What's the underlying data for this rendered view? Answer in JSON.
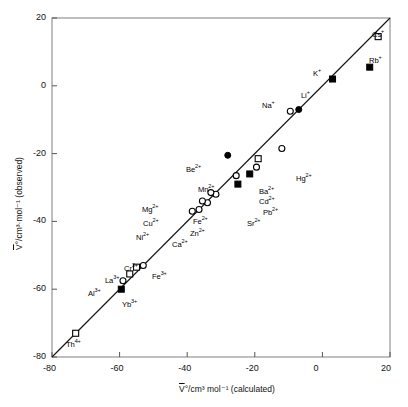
{
  "chart_data": {
    "type": "scatter",
    "title": "",
    "xlabel": "V̄°/cm³ mol⁻¹ (calculated)",
    "ylabel": "V̄°/cm³·mol⁻¹ (observed)",
    "xlim": [
      -80,
      20
    ],
    "ylim": [
      -80,
      20
    ],
    "xticks": [
      -80,
      -60,
      -40,
      -20,
      0,
      20
    ],
    "xticklabels": [
      "-80",
      "-60",
      "-40",
      "-20",
      "0",
      "20"
    ],
    "yticks": [
      -80,
      -60,
      -40,
      -20,
      0,
      20
    ],
    "yticklabels": [
      "-80",
      "-60",
      "-40",
      "-20",
      "0",
      "20"
    ],
    "grid": false,
    "legend": "none",
    "reference_line": {
      "name": "one-to-one-line",
      "description": "y = x diagonal",
      "slope": 1,
      "intercept": 0,
      "from": [
        -80,
        -80
      ],
      "to": [
        20,
        20
      ]
    },
    "marker_styles": {
      "open-circle": "open circle",
      "filled-circle": "filled circle",
      "open-square": "open square",
      "filled-square": "filled square"
    },
    "points": [
      {
        "label": "Cs⁺",
        "html": "Cs<sup>+</sup>",
        "x": 16.5,
        "y": 14.5,
        "marker": "open-square",
        "lx": 372,
        "ly": 30
      },
      {
        "label": "Rb⁺",
        "html": "Rb<sup>+</sup>",
        "x": 14.0,
        "y": 5.5,
        "marker": "filled-square",
        "lx": 369,
        "ly": 56
      },
      {
        "label": "K⁺",
        "html": "K<sup>+</sup>",
        "x": 3.0,
        "y": 2.0,
        "marker": "filled-square",
        "lx": 313,
        "ly": 69
      },
      {
        "label": "Li⁺",
        "html": "Li<sup>+</sup>",
        "x": -7.0,
        "y": -7.0,
        "marker": "filled-circle",
        "lx": 301,
        "ly": 91
      },
      {
        "label": "Na⁺",
        "html": "Na<sup>+</sup>",
        "x": -9.5,
        "y": -7.5,
        "marker": "open-circle",
        "lx": 262,
        "ly": 101
      },
      {
        "label": "Hg²⁺",
        "html": "Hg<sup>2+</sup>",
        "x": -12.0,
        "y": -18.5,
        "marker": "open-circle",
        "lx": 296,
        "ly": 174
      },
      {
        "label": "Ba²⁺",
        "html": "Ba<sup>2+</sup>",
        "x": -19.0,
        "y": -21.5,
        "marker": "open-square",
        "lx": 259,
        "ly": 187
      },
      {
        "label": "Cd²⁺",
        "html": "Cd<sup>2+</sup>",
        "x": -19.5,
        "y": -24.0,
        "marker": "open-circle",
        "lx": 259,
        "ly": 197
      },
      {
        "label": "Be²⁺",
        "html": "Be<sup>2+</sup>",
        "x": -28.0,
        "y": -20.5,
        "marker": "filled-circle",
        "lx": 186,
        "ly": 165
      },
      {
        "label": "Pb²⁺",
        "html": "Pb<sup>2+</sup>",
        "x": -21.5,
        "y": -26.0,
        "marker": "filled-square",
        "lx": 263,
        "ly": 208
      },
      {
        "label": "Mn²⁺",
        "html": "Mn<sup>2+</sup>",
        "x": -25.5,
        "y": -26.5,
        "marker": "open-circle",
        "lx": 198,
        "ly": 185
      },
      {
        "label": "Sr²⁺",
        "html": "Sr<sup>2+</sup>",
        "x": -25.0,
        "y": -29.0,
        "marker": "filled-square",
        "lx": 247,
        "ly": 219
      },
      {
        "label": "Fe²⁺",
        "html": "Fe<sup>2+</sup>",
        "x": -31.5,
        "y": -32.0,
        "marker": "open-circle",
        "lx": 193,
        "ly": 217
      },
      {
        "label": "Mg²⁺",
        "html": "Mg<sup>2+</sup>",
        "x": -33.0,
        "y": -31.5,
        "marker": "open-circle",
        "lx": 142,
        "ly": 205
      },
      {
        "label": "Zn²⁺",
        "html": "Zn<sup>2+</sup>",
        "x": -34.0,
        "y": -34.5,
        "marker": "open-circle",
        "lx": 190,
        "ly": 229
      },
      {
        "label": "Cu²⁺",
        "html": "Cu<sup>2+</sup>",
        "x": -35.5,
        "y": -34.0,
        "marker": "open-circle",
        "lx": 143,
        "ly": 219
      },
      {
        "label": "Ca²⁺",
        "html": "Ca<sup>2+</sup>",
        "x": -36.5,
        "y": -36.5,
        "marker": "open-circle",
        "lx": 172,
        "ly": 240
      },
      {
        "label": "Ni²⁺",
        "html": "Ni<sup>2+</sup>",
        "x": -38.5,
        "y": -37.0,
        "marker": "open-circle",
        "lx": 136,
        "ly": 233
      },
      {
        "label": "Fe³⁺",
        "html": "Fe<sup>3+</sup>",
        "x": -53.0,
        "y": -53.0,
        "marker": "open-circle",
        "lx": 152,
        "ly": 272
      },
      {
        "label": "Cr³⁺",
        "html": "Cr<sup>3+</sup>",
        "x": -55.0,
        "y": -53.5,
        "marker": "open-square",
        "lx": 124,
        "ly": 264
      },
      {
        "label": "La³⁺",
        "html": "La<sup>3+</sup>",
        "x": -57.0,
        "y": -55.5,
        "marker": "open-square",
        "lx": 105,
        "ly": 276
      },
      {
        "label": "Al³⁺",
        "html": "Al<sup>3+</sup>",
        "x": -59.0,
        "y": -57.5,
        "marker": "open-circle",
        "lx": 88,
        "ly": 289
      },
      {
        "label": "Yb³⁺",
        "html": "Yb<sup>3+</sup>",
        "x": -59.5,
        "y": -60.0,
        "marker": "filled-square",
        "lx": 122,
        "ly": 300
      },
      {
        "label": "Th⁴⁺",
        "html": "Th<sup>4+</sup>",
        "x": -73.0,
        "y": -73.0,
        "marker": "open-square",
        "lx": 66,
        "ly": 340
      }
    ]
  },
  "axes_geometry": {
    "left_px": 52,
    "right_px": 390,
    "top_px": 18,
    "bottom_px": 357
  }
}
